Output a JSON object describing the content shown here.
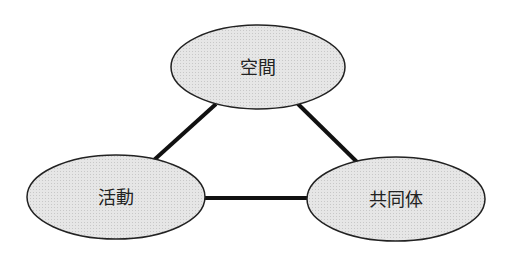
{
  "diagram": {
    "type": "triangle-relationship",
    "colors": {
      "node_fill": "#e2e2e2",
      "node_stroke": "#222222",
      "edge": "#111111",
      "background": "#ffffff"
    },
    "nodes": [
      {
        "id": "space",
        "label": "空間",
        "cx": 258,
        "cy": 67,
        "rx": 87,
        "ry": 42
      },
      {
        "id": "activity",
        "label": "活動",
        "cx": 116,
        "cy": 197,
        "rx": 89,
        "ry": 42
      },
      {
        "id": "community",
        "label": "共同体",
        "cx": 396,
        "cy": 199,
        "rx": 89,
        "ry": 42
      }
    ],
    "edges": [
      {
        "from": "space",
        "to": "activity"
      },
      {
        "from": "space",
        "to": "community"
      },
      {
        "from": "activity",
        "to": "community"
      }
    ]
  }
}
